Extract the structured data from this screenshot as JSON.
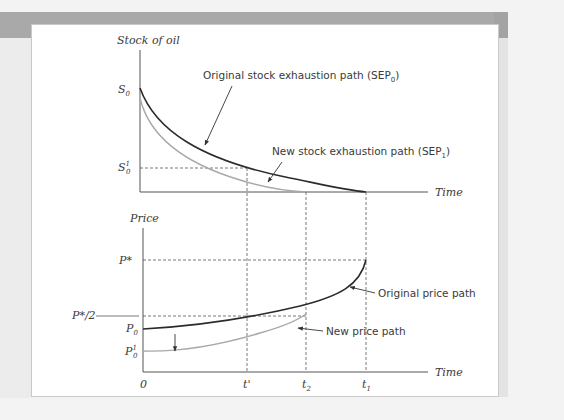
{
  "figure": {
    "upper_panel": {
      "y_axis_label": "Stock of oil",
      "x_axis_label": "Time",
      "y_ticks": [
        {
          "base": "S",
          "sup": "",
          "sub": "0"
        },
        {
          "base": "S",
          "sup": "1",
          "sub": "0"
        }
      ],
      "curves": [
        {
          "name": "Original stock exhaustion path",
          "label_main": "Original stock exhaustion path (SEP",
          "label_sub": "0",
          "label_end": ")",
          "color": "#2b2b2b"
        },
        {
          "name": "New stock exhaustion path",
          "label_main": "New stock exhaustion path (SEP",
          "label_sub": "1",
          "label_end": ")",
          "color": "#a8a8a8"
        }
      ]
    },
    "lower_panel": {
      "y_axis_label": "Price",
      "x_axis_label": "Time",
      "y_ticks": [
        {
          "base": "P*",
          "sup": "",
          "sub": ""
        },
        {
          "base": "P*/2",
          "sup": "",
          "sub": ""
        },
        {
          "base": "P",
          "sup": "",
          "sub": "0"
        },
        {
          "base": "P",
          "sup": "1",
          "sub": "0"
        }
      ],
      "x_ticks": [
        {
          "base": "0",
          "sub": ""
        },
        {
          "base": "t'",
          "sub": ""
        },
        {
          "base": "t",
          "sub": "2"
        },
        {
          "base": "t",
          "sub": "1"
        }
      ],
      "curves": [
        {
          "name": "Original price path",
          "label": "Original price path",
          "color": "#2b2b2b"
        },
        {
          "name": "New price path",
          "label": "New price path",
          "color": "#a8a8a8"
        }
      ]
    },
    "colors": {
      "axis": "#555555",
      "dashed": "#555555",
      "original": "#2b2b2b",
      "new": "#a8a8a8",
      "frame_band": "#a9a9a9"
    }
  }
}
